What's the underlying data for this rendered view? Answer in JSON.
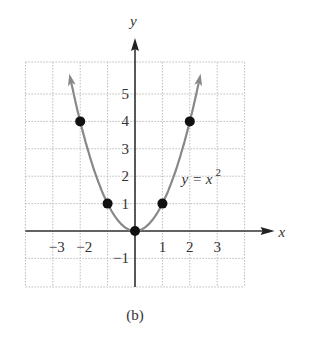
{
  "chart_data": {
    "type": "line",
    "title": "",
    "caption": "(b)",
    "xlabel": "x",
    "ylabel": "y",
    "xlim": [
      -4,
      4
    ],
    "ylim": [
      -2,
      6.2
    ],
    "grid": true,
    "x_ticks": [
      -3,
      -2,
      1,
      2,
      3
    ],
    "x_tick_labels": [
      "−3",
      "−2",
      "1",
      "2",
      "3"
    ],
    "y_ticks": [
      -1,
      1,
      2,
      3,
      4,
      5
    ],
    "y_tick_labels": [
      "−1",
      "1",
      "2",
      "3",
      "4",
      "5"
    ],
    "series": [
      {
        "name": "y = x^2",
        "function": "x^2",
        "x_range": [
          -2.35,
          2.35
        ]
      }
    ],
    "points": [
      {
        "x": -2,
        "y": 4
      },
      {
        "x": -1,
        "y": 1
      },
      {
        "x": 0,
        "y": 0
      },
      {
        "x": 1,
        "y": 1
      },
      {
        "x": 2,
        "y": 4
      }
    ],
    "annotation": {
      "text_base": "y = x",
      "superscript": "2"
    }
  }
}
